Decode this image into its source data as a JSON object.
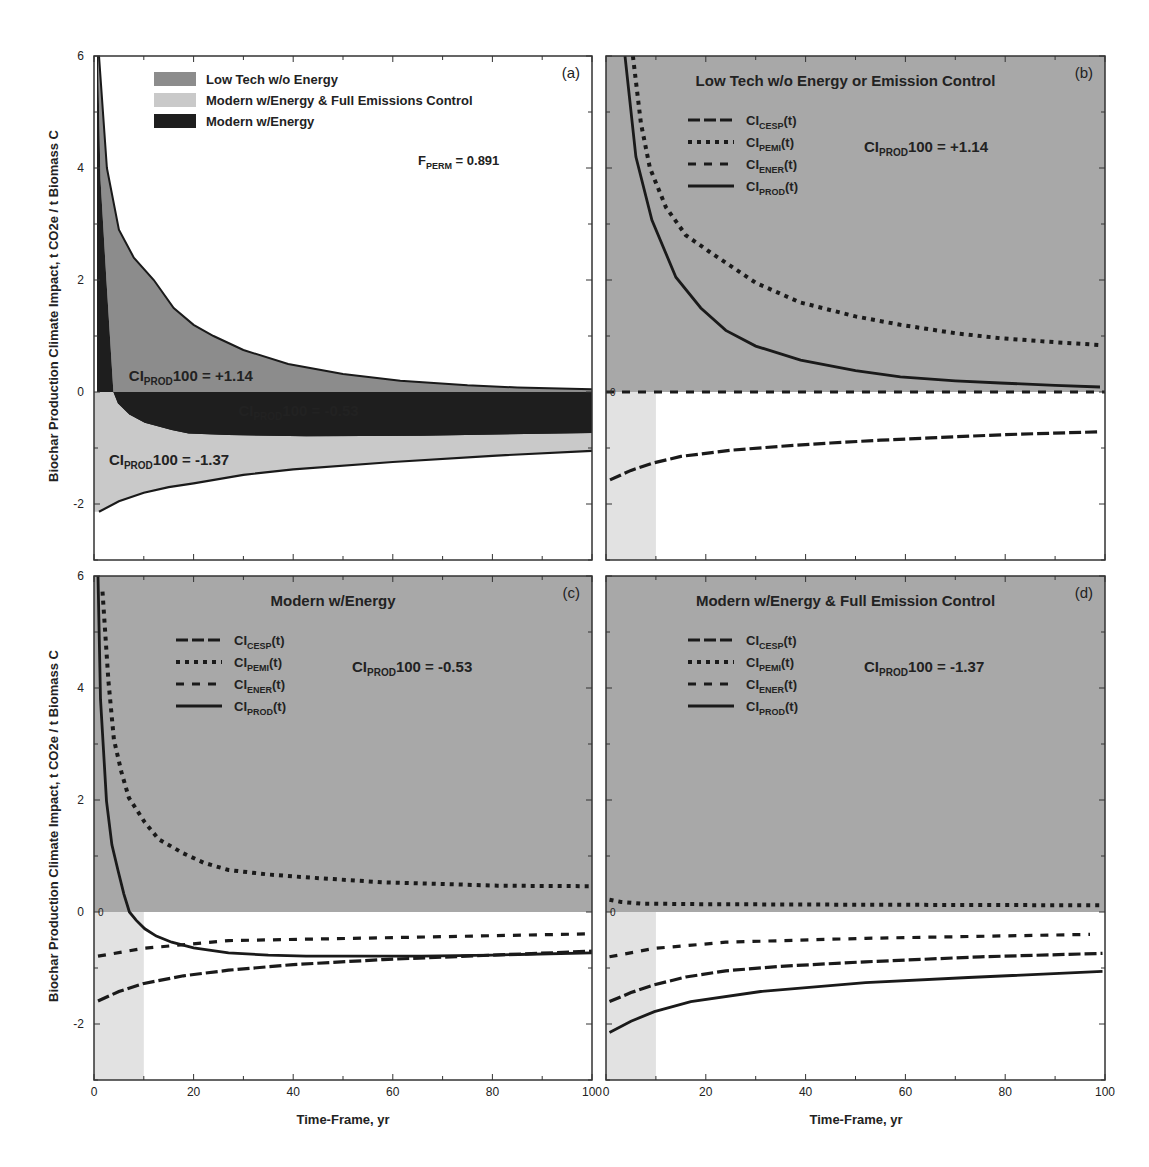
{
  "figure": {
    "ylabel": "Biochar Production Climate Impact, t CO2e / t Biomass C",
    "xlabel": "Time-Frame, yr",
    "colors": {
      "low_tech": "#8c8c8c",
      "modern_full": "#c9c9c9",
      "modern_energy": "#1e1e1e",
      "panel_bg": "#a8a8a8",
      "shade_0_10": "#e2e2e2",
      "line": "#1a1a1a",
      "axis": "#333333"
    }
  },
  "chart_data": [
    {
      "id": "a",
      "type": "area",
      "panel_label": "(a)",
      "title": "",
      "annotation": {
        "main": "F",
        "sub": "PERM",
        "rest": " = 0.891"
      },
      "xlim": [
        0,
        100
      ],
      "ylim": [
        -3,
        6
      ],
      "xticks": [
        0,
        20,
        40,
        60,
        80,
        100
      ],
      "yticks": [
        -2,
        0,
        2,
        4,
        6
      ],
      "legend": [
        {
          "label": "Low Tech w/o Energy",
          "color_key": "low_tech"
        },
        {
          "label": "Modern w/Energy & Full Emissions Control",
          "color_key": "modern_full"
        },
        {
          "label": "Modern w/Energy",
          "color_key": "modern_energy"
        }
      ],
      "region_labels": [
        {
          "pre": "CI",
          "sub": "PROD",
          "post": "100 = +1.14",
          "x": 7,
          "y": 0.3,
          "color": "#222"
        },
        {
          "pre": "CI",
          "sub": "PROD",
          "post": "100 = -0.53",
          "x": 29,
          "y": -0.33,
          "color": "#eee"
        },
        {
          "pre": "CI",
          "sub": "PROD",
          "post": "100 = -1.37",
          "x": 3,
          "y": -1.2,
          "color": "#222"
        }
      ],
      "series": [
        {
          "name": "Low Tech w/o Energy",
          "t": [
            1,
            2.6,
            5,
            8,
            12,
            16,
            20,
            24,
            30,
            39,
            50,
            61.5,
            75,
            85,
            100
          ],
          "y": [
            6,
            4,
            2.9,
            2.4,
            2.0,
            1.5,
            1.2,
            1.0,
            0.75,
            0.5,
            0.32,
            0.2,
            0.12,
            0.08,
            0.05
          ]
        },
        {
          "name": "Modern w/Energy",
          "t": [
            0.8,
            1.3,
            2.5,
            3.9,
            4.8,
            7.1,
            10.2,
            15.6,
            19,
            27,
            42.6,
            65.7,
            100
          ],
          "y": [
            6,
            3.8,
            1.98,
            0,
            -0.2,
            -0.4,
            -0.55,
            -0.68,
            -0.74,
            -0.77,
            -0.79,
            -0.78,
            -0.73
          ]
        },
        {
          "name": "Modern w/Energy & Full Emissions Control",
          "t": [
            1,
            5,
            10,
            15,
            20,
            30,
            40,
            60,
            80,
            100
          ],
          "y": [
            -2.14,
            -1.95,
            -1.8,
            -1.7,
            -1.63,
            -1.48,
            -1.38,
            -1.25,
            -1.14,
            -1.05
          ]
        }
      ]
    },
    {
      "id": "b",
      "type": "line",
      "panel_label": "(b)",
      "title": "Low Tech w/o Energy or Emission Control",
      "annotation": {
        "main": "CI",
        "sub": "PROD",
        "rest": "100 = +1.14"
      },
      "xlim": [
        0,
        100
      ],
      "ylim": [
        -3,
        6
      ],
      "xticks": [
        0,
        20,
        40,
        60,
        80,
        100
      ],
      "yticks": [
        -2,
        0,
        2,
        4,
        6
      ],
      "legend": [
        {
          "pre": "CI",
          "sub": "CESP",
          "post": "(t)",
          "style": "longdash"
        },
        {
          "pre": "CI",
          "sub": "PEMI",
          "post": "(t)",
          "style": "dotted"
        },
        {
          "pre": "CI",
          "sub": "ENER",
          "post": "(t)",
          "style": "dashed"
        },
        {
          "pre": "CI",
          "sub": "PROD",
          "post": "(t)",
          "style": "solid"
        }
      ],
      "series": [
        {
          "name": "CI_CESP(t)",
          "style": "longdash",
          "t": [
            0.8,
            5,
            9.4,
            15,
            25,
            35,
            45,
            55,
            65,
            80,
            99
          ],
          "y": [
            -1.57,
            -1.4,
            -1.27,
            -1.15,
            -1.04,
            -0.97,
            -0.91,
            -0.86,
            -0.82,
            -0.76,
            -0.71
          ]
        },
        {
          "name": "CI_PEMI(t)",
          "style": "dotted",
          "t": [
            5.4,
            7,
            8.8,
            12,
            16,
            20.8,
            30,
            38.9,
            50,
            59,
            70,
            79,
            90,
            99
          ],
          "y": [
            6,
            4.8,
            4.0,
            3.3,
            2.8,
            2.5,
            1.95,
            1.6,
            1.35,
            1.2,
            1.05,
            0.96,
            0.89,
            0.84
          ]
        },
        {
          "name": "CI_ENER(t)",
          "style": "dashed",
          "t": [
            0,
            100
          ],
          "y": [
            0,
            0
          ]
        },
        {
          "name": "CI_PROD(t)",
          "style": "solid",
          "t": [
            3.8,
            6,
            9.2,
            14,
            19,
            24,
            30,
            39,
            50,
            59,
            70,
            79,
            90,
            99
          ],
          "y": [
            6,
            4.2,
            3.07,
            2.05,
            1.5,
            1.1,
            0.82,
            0.57,
            0.38,
            0.27,
            0.2,
            0.16,
            0.12,
            0.09
          ]
        }
      ]
    },
    {
      "id": "c",
      "type": "line",
      "panel_label": "(c)",
      "title": "Modern w/Energy",
      "annotation": {
        "main": "CI",
        "sub": "PROD",
        "rest": "100 = -0.53"
      },
      "xlim": [
        0,
        100
      ],
      "ylim": [
        -3,
        6
      ],
      "xticks": [
        0,
        20,
        40,
        60,
        80,
        100
      ],
      "yticks": [
        -2,
        0,
        2,
        4,
        6
      ],
      "legend": [
        {
          "pre": "CI",
          "sub": "CESP",
          "post": "(t)",
          "style": "longdash"
        },
        {
          "pre": "CI",
          "sub": "PEMI",
          "post": "(t)",
          "style": "dotted"
        },
        {
          "pre": "CI",
          "sub": "ENER",
          "post": "(t)",
          "style": "dashed"
        },
        {
          "pre": "CI",
          "sub": "PROD",
          "post": "(t)",
          "style": "solid"
        }
      ],
      "series": [
        {
          "name": "CI_CESP(t)",
          "style": "longdash",
          "t": [
            0.8,
            5,
            9.8,
            18,
            27,
            40,
            58,
            80,
            100
          ],
          "y": [
            -1.59,
            -1.42,
            -1.28,
            -1.14,
            -1.04,
            -0.94,
            -0.85,
            -0.77,
            -0.7
          ]
        },
        {
          "name": "CI_PEMI(t)",
          "style": "dotted",
          "t": [
            1.7,
            2.9,
            4,
            5.5,
            7,
            10.2,
            13,
            17.9,
            22,
            27,
            35,
            42.6,
            58,
            70,
            81,
            99.6
          ],
          "y": [
            5.72,
            4.13,
            3.08,
            2.5,
            2.04,
            1.6,
            1.3,
            1.05,
            0.88,
            0.75,
            0.67,
            0.62,
            0.53,
            0.5,
            0.47,
            0.46
          ]
        },
        {
          "name": "CI_ENER(t)",
          "style": "dashed",
          "t": [
            0.8,
            9.8,
            27,
            58,
            100
          ],
          "y": [
            -0.79,
            -0.65,
            -0.51,
            -0.46,
            -0.39
          ]
        },
        {
          "name": "CI_PROD(t)",
          "style": "solid",
          "t": [
            0.8,
            1.3,
            2.5,
            3.6,
            4.8,
            6,
            7.1,
            8.5,
            10.2,
            12.5,
            15.6,
            20,
            27,
            35,
            42.6,
            55,
            65.7,
            80,
            100
          ],
          "y": [
            6,
            3.8,
            1.98,
            1.2,
            0.75,
            0.32,
            0.0,
            -0.15,
            -0.3,
            -0.43,
            -0.54,
            -0.64,
            -0.73,
            -0.77,
            -0.79,
            -0.79,
            -0.79,
            -0.77,
            -0.73
          ]
        }
      ]
    },
    {
      "id": "d",
      "type": "line",
      "panel_label": "(d)",
      "title": "Modern w/Energy & Full Emission Control",
      "annotation": {
        "main": "CI",
        "sub": "PROD",
        "rest": "100 = -1.37"
      },
      "xlim": [
        0,
        100
      ],
      "ylim": [
        -3,
        6
      ],
      "xticks": [
        0,
        20,
        40,
        60,
        80,
        100
      ],
      "yticks": [
        -2,
        0,
        2,
        4,
        6
      ],
      "legend": [
        {
          "pre": "CI",
          "sub": "CESP",
          "post": "(t)",
          "style": "longdash"
        },
        {
          "pre": "CI",
          "sub": "PEMI",
          "post": "(t)",
          "style": "dotted"
        },
        {
          "pre": "CI",
          "sub": "ENER",
          "post": "(t)",
          "style": "dashed"
        },
        {
          "pre": "CI",
          "sub": "PROD",
          "post": "(t)",
          "style": "solid"
        }
      ],
      "series": [
        {
          "name": "CI_CESP(t)",
          "style": "longdash",
          "t": [
            0.7,
            5,
            9.7,
            16,
            24,
            35,
            52,
            75,
            99.5
          ],
          "y": [
            -1.6,
            -1.44,
            -1.3,
            -1.16,
            -1.05,
            -0.97,
            -0.89,
            -0.8,
            -0.74
          ]
        },
        {
          "name": "CI_PEMI(t)",
          "style": "dotted",
          "t": [
            0.7,
            3,
            6.9,
            20,
            50,
            99.5
          ],
          "y": [
            0.22,
            0.18,
            0.15,
            0.14,
            0.13,
            0.12
          ]
        },
        {
          "name": "CI_ENER(t)",
          "style": "dashed",
          "t": [
            0.7,
            9.7,
            24,
            52,
            97
          ],
          "y": [
            -0.8,
            -0.65,
            -0.54,
            -0.47,
            -0.4
          ]
        },
        {
          "name": "CI_PROD(t)",
          "style": "solid",
          "t": [
            0.7,
            5,
            9.7,
            17,
            31,
            52,
            72.6,
            99.5
          ],
          "y": [
            -2.15,
            -1.95,
            -1.78,
            -1.6,
            -1.42,
            -1.26,
            -1.17,
            -1.06
          ]
        }
      ]
    }
  ]
}
